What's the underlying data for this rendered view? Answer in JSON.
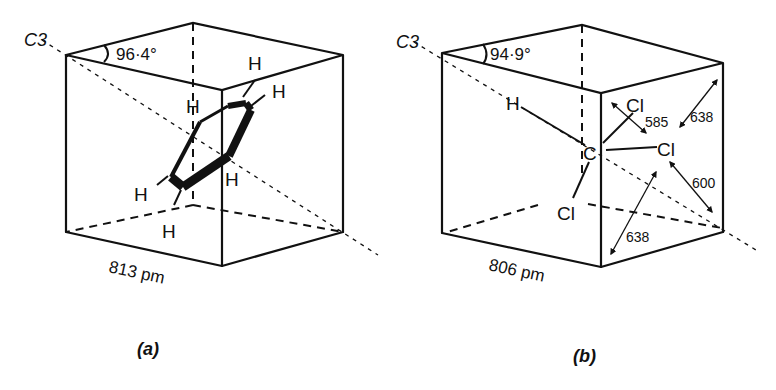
{
  "figure": {
    "panels": [
      {
        "id": "a",
        "caption": "(a)",
        "axis_label": "C3",
        "angle_label": "96·4°",
        "edge_label": "813 pm",
        "molecule": "benzene",
        "atom_labels": [
          "H",
          "H",
          "H",
          "H",
          "H",
          "H"
        ]
      },
      {
        "id": "b",
        "caption": "(b)",
        "axis_label": "C3",
        "angle_label": "94·9°",
        "edge_label": "806 pm",
        "molecule": "chloroform",
        "atom_labels": {
          "carbon": "C",
          "hydrogen": "H",
          "chlorines": [
            "Cl",
            "Cl",
            "Cl"
          ]
        },
        "distance_labels": [
          "585",
          "638",
          "600",
          "638"
        ]
      }
    ]
  }
}
